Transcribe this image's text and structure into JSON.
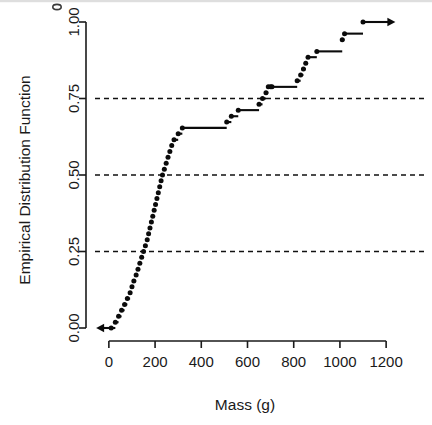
{
  "figure": {
    "name": "empirical-distribution-function-plot",
    "background_color": "#ffffff",
    "foreground_color": "#0b0b0b",
    "grid_color": "#111111"
  },
  "axes": {
    "x_title": "Mass (g)",
    "y_title": "Empirical Distribution Function",
    "x_ticks": [
      "0",
      "200",
      "400",
      "600",
      "800",
      "1000",
      "1200"
    ],
    "y_ticks": [
      "0.00",
      "0.25",
      "0.50",
      "0.75",
      "1.00"
    ]
  },
  "chart_data": {
    "type": "line",
    "subtype": "empirical-cumulative-distribution-step",
    "title": "",
    "xlabel": "Mass (g)",
    "ylabel": "Empirical Distribution Function",
    "xlim": [
      -60,
      1260
    ],
    "ylim": [
      0.0,
      1.0
    ],
    "x_ticks": [
      0,
      200,
      400,
      600,
      800,
      1000,
      1200
    ],
    "y_ticks": [
      0.0,
      0.25,
      0.5,
      0.75,
      1.0
    ],
    "grid": "horizontal dashed reference lines at 0.25, 0.50, 0.75",
    "gridlines_y": [
      0.25,
      0.5,
      0.75
    ],
    "legend": "none",
    "left_tail_arrow": {
      "from_x": 10,
      "to_x": -55,
      "y": 0.0
    },
    "right_tail_arrow": {
      "from_x": 1100,
      "to_x": 1240,
      "y": 1.0
    },
    "n_points": 52,
    "x": [
      10,
      28,
      42,
      55,
      68,
      80,
      92,
      100,
      108,
      118,
      126,
      134,
      142,
      150,
      158,
      166,
      172,
      178,
      184,
      190,
      196,
      202,
      208,
      214,
      220,
      226,
      232,
      240,
      248,
      256,
      264,
      272,
      282,
      300,
      318,
      510,
      530,
      560,
      650,
      665,
      680,
      690,
      700,
      706,
      815,
      830,
      842,
      852,
      862,
      900,
      1010,
      1020,
      1100
    ],
    "y": [
      0.0,
      0.019,
      0.038,
      0.058,
      0.077,
      0.096,
      0.115,
      0.135,
      0.154,
      0.173,
      0.192,
      0.212,
      0.231,
      0.25,
      0.269,
      0.288,
      0.308,
      0.327,
      0.346,
      0.365,
      0.385,
      0.404,
      0.423,
      0.442,
      0.462,
      0.481,
      0.5,
      0.519,
      0.538,
      0.558,
      0.577,
      0.596,
      0.615,
      0.635,
      0.654,
      0.673,
      0.692,
      0.712,
      0.731,
      0.75,
      0.769,
      0.788,
      0.788,
      0.788,
      0.808,
      0.827,
      0.846,
      0.865,
      0.885,
      0.904,
      0.942,
      0.962,
      1.0
    ]
  }
}
